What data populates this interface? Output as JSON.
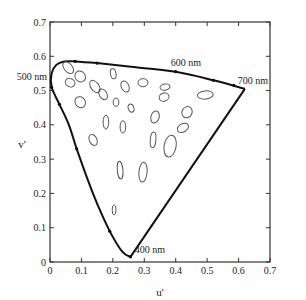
{
  "chart_data": {
    "type": "scatter",
    "title": "",
    "xlabel": "u'",
    "ylabel": "v'",
    "xlim": [
      0,
      0.7
    ],
    "ylim": [
      0,
      0.7
    ],
    "grid": false,
    "legend": null,
    "x_ticks": [
      "0",
      "0.1",
      "0.2",
      "0.3",
      "0.4",
      "0.5",
      "0.6",
      "0.7"
    ],
    "y_ticks": [
      "0",
      "0.1",
      "0.2",
      "0.3",
      "0.4",
      "0.5",
      "0.6",
      "0.7"
    ],
    "annotations": [
      {
        "text": "500 nm",
        "u": 0.005,
        "v": 0.51
      },
      {
        "text": "600 nm",
        "u": 0.4,
        "v": 0.555
      },
      {
        "text": "700 nm",
        "u": 0.62,
        "v": 0.505
      },
      {
        "text": "400 nm",
        "u": 0.26,
        "v": 0.015
      }
    ],
    "spectral_locus": {
      "name": "Spectral locus (CIE 1976 u'v')",
      "points": [
        [
          0.256,
          0.015
        ],
        [
          0.23,
          0.03
        ],
        [
          0.19,
          0.09
        ],
        [
          0.15,
          0.17
        ],
        [
          0.12,
          0.24
        ],
        [
          0.085,
          0.33
        ],
        [
          0.06,
          0.4
        ],
        [
          0.03,
          0.46
        ],
        [
          0.005,
          0.51
        ],
        [
          0.005,
          0.55
        ],
        [
          0.02,
          0.575
        ],
        [
          0.045,
          0.585
        ],
        [
          0.08,
          0.585
        ],
        [
          0.15,
          0.58
        ],
        [
          0.25,
          0.57
        ],
        [
          0.4,
          0.555
        ],
        [
          0.52,
          0.53
        ],
        [
          0.62,
          0.505
        ]
      ],
      "purple_line": [
        [
          0.62,
          0.505
        ],
        [
          0.256,
          0.015
        ]
      ]
    },
    "series": [
      {
        "name": "MacAdam ellipses (magnified)",
        "ellipses": [
          {
            "u": 0.058,
            "v": 0.567,
            "rx": 0.013,
            "ry": 0.02,
            "angle": -40
          },
          {
            "u": 0.096,
            "v": 0.541,
            "rx": 0.016,
            "ry": 0.017,
            "angle": -40
          },
          {
            "u": 0.064,
            "v": 0.523,
            "rx": 0.016,
            "ry": 0.012,
            "angle": 25
          },
          {
            "u": 0.143,
            "v": 0.512,
            "rx": 0.013,
            "ry": 0.02,
            "angle": -35
          },
          {
            "u": 0.169,
            "v": 0.489,
            "rx": 0.012,
            "ry": 0.017,
            "angle": -30
          },
          {
            "u": 0.096,
            "v": 0.466,
            "rx": 0.016,
            "ry": 0.017,
            "angle": -35
          },
          {
            "u": 0.201,
            "v": 0.549,
            "rx": 0.009,
            "ry": 0.015,
            "angle": -10
          },
          {
            "u": 0.239,
            "v": 0.512,
            "rx": 0.012,
            "ry": 0.017,
            "angle": -25
          },
          {
            "u": 0.296,
            "v": 0.523,
            "rx": 0.016,
            "ry": 0.012,
            "angle": 0
          },
          {
            "u": 0.21,
            "v": 0.466,
            "rx": 0.009,
            "ry": 0.012,
            "angle": 0
          },
          {
            "u": 0.258,
            "v": 0.449,
            "rx": 0.009,
            "ry": 0.012,
            "angle": -20
          },
          {
            "u": 0.178,
            "v": 0.408,
            "rx": 0.009,
            "ry": 0.02,
            "angle": 0
          },
          {
            "u": 0.232,
            "v": 0.394,
            "rx": 0.009,
            "ry": 0.018,
            "angle": 0
          },
          {
            "u": 0.137,
            "v": 0.356,
            "rx": 0.012,
            "ry": 0.017,
            "angle": -25
          },
          {
            "u": 0.366,
            "v": 0.51,
            "rx": 0.016,
            "ry": 0.009,
            "angle": -10
          },
          {
            "u": 0.363,
            "v": 0.481,
            "rx": 0.016,
            "ry": 0.012,
            "angle": -20
          },
          {
            "u": 0.334,
            "v": 0.423,
            "rx": 0.013,
            "ry": 0.018,
            "angle": 15
          },
          {
            "u": 0.328,
            "v": 0.356,
            "rx": 0.009,
            "ry": 0.023,
            "angle": 5
          },
          {
            "u": 0.223,
            "v": 0.268,
            "rx": 0.009,
            "ry": 0.026,
            "angle": -5
          },
          {
            "u": 0.296,
            "v": 0.262,
            "rx": 0.013,
            "ry": 0.029,
            "angle": 5
          },
          {
            "u": 0.436,
            "v": 0.437,
            "rx": 0.016,
            "ry": 0.017,
            "angle": 30
          },
          {
            "u": 0.423,
            "v": 0.391,
            "rx": 0.019,
            "ry": 0.012,
            "angle": -30
          },
          {
            "u": 0.382,
            "v": 0.338,
            "rx": 0.019,
            "ry": 0.032,
            "angle": 10
          },
          {
            "u": 0.494,
            "v": 0.487,
            "rx": 0.025,
            "ry": 0.012,
            "angle": -5
          },
          {
            "u": 0.204,
            "v": 0.152,
            "rx": 0.006,
            "ry": 0.015,
            "angle": 0
          }
        ]
      }
    ]
  },
  "labels": {
    "xlabel": "u'",
    "ylabel": "v'",
    "nm500": "500 nm",
    "nm600": "600 nm",
    "nm700": "700 nm",
    "nm400": "400 nm"
  }
}
